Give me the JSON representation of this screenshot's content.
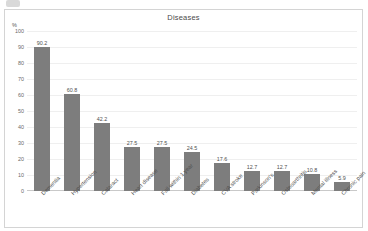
{
  "chart_data": {
    "type": "bar",
    "title": "Diseases",
    "xlabel": "",
    "ylabel": "%",
    "ylim": [
      0,
      100
    ],
    "ytick_step": 10,
    "yticks": [
      "100",
      "90",
      "80",
      "70",
      "60",
      "50",
      "40",
      "30",
      "20",
      "10",
      "0"
    ],
    "grid": true,
    "legend": "none",
    "bar_color": "#7d7d7d",
    "categories": [
      "Dementia",
      "Hypertension",
      "Cataract",
      "Heart disease",
      "Fall within 1 year",
      "Diabetes",
      "CVA stroke",
      "Parkinson's",
      "Osteoarthritis",
      "Mental illness",
      "Chronic pain"
    ],
    "values": [
      90.2,
      60.8,
      42.2,
      27.5,
      27.5,
      24.5,
      17.6,
      12.7,
      12.7,
      10.8,
      5.9
    ],
    "value_labels": [
      "90.2",
      "60.8",
      "42.2",
      "27.5",
      "27.5",
      "24.5",
      "17.6",
      "12.7",
      "12.7",
      "10.8",
      "5.9"
    ]
  }
}
